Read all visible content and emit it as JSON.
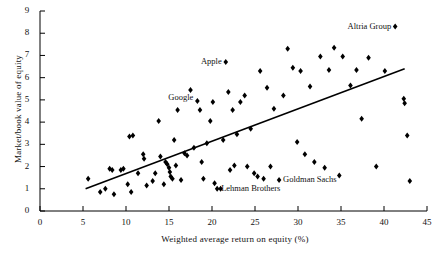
{
  "chart_data": {
    "type": "scatter",
    "title": "",
    "xlabel": "Weighted average return on equity (%)",
    "ylabel": "Market/book value of equity",
    "xlim": [
      0,
      45
    ],
    "ylim": [
      0,
      9
    ],
    "xticks": [
      0,
      5,
      10,
      15,
      20,
      25,
      30,
      35,
      40,
      45
    ],
    "yticks": [
      0,
      1,
      2,
      3,
      4,
      5,
      6,
      7,
      8,
      9
    ],
    "grid": false,
    "legend": "none",
    "trendline": {
      "x0": 5.3,
      "y0": 1.0,
      "x1": 42.4,
      "y1": 6.4
    },
    "annotations": [
      {
        "label": "Altria Group",
        "x": 41.3,
        "y": 8.3,
        "anchor": "right"
      },
      {
        "label": "Apple",
        "x": 21.6,
        "y": 6.7,
        "anchor": "right"
      },
      {
        "label": "Google",
        "x": 18.3,
        "y": 5.1,
        "anchor": "right"
      },
      {
        "label": "Halliburton",
        "x": 47.0,
        "y": 4.9,
        "anchor": "left"
      },
      {
        "label": "Goldman Sachs",
        "x": 27.8,
        "y": 1.4,
        "anchor": "left"
      },
      {
        "label": "Lehman Brothers",
        "x": 20.6,
        "y": 1.0,
        "anchor": "left"
      }
    ],
    "points": [
      {
        "x": 5.6,
        "y": 1.45
      },
      {
        "x": 7.0,
        "y": 0.85
      },
      {
        "x": 7.6,
        "y": 1.0
      },
      {
        "x": 8.1,
        "y": 1.9
      },
      {
        "x": 8.4,
        "y": 1.85
      },
      {
        "x": 8.6,
        "y": 0.75
      },
      {
        "x": 9.4,
        "y": 1.85
      },
      {
        "x": 9.7,
        "y": 1.9
      },
      {
        "x": 10.2,
        "y": 1.2
      },
      {
        "x": 10.4,
        "y": 3.35
      },
      {
        "x": 10.8,
        "y": 3.4
      },
      {
        "x": 10.6,
        "y": 0.85
      },
      {
        "x": 11.4,
        "y": 1.7
      },
      {
        "x": 12.0,
        "y": 2.55
      },
      {
        "x": 12.1,
        "y": 2.35
      },
      {
        "x": 12.4,
        "y": 1.15
      },
      {
        "x": 13.1,
        "y": 1.35
      },
      {
        "x": 13.4,
        "y": 1.7
      },
      {
        "x": 13.8,
        "y": 4.05
      },
      {
        "x": 14.0,
        "y": 2.45
      },
      {
        "x": 14.4,
        "y": 1.2
      },
      {
        "x": 14.6,
        "y": 2.2
      },
      {
        "x": 14.8,
        "y": 2.1
      },
      {
        "x": 15.0,
        "y": 1.95
      },
      {
        "x": 15.1,
        "y": 1.75
      },
      {
        "x": 15.2,
        "y": 1.55
      },
      {
        "x": 15.4,
        "y": 1.45
      },
      {
        "x": 15.6,
        "y": 3.2
      },
      {
        "x": 15.8,
        "y": 2.05
      },
      {
        "x": 16.0,
        "y": 4.55
      },
      {
        "x": 16.4,
        "y": 1.4
      },
      {
        "x": 16.8,
        "y": 2.6
      },
      {
        "x": 17.1,
        "y": 2.5
      },
      {
        "x": 17.5,
        "y": 5.45
      },
      {
        "x": 17.9,
        "y": 2.85
      },
      {
        "x": 18.3,
        "y": 4.95
      },
      {
        "x": 18.6,
        "y": 4.55
      },
      {
        "x": 18.8,
        "y": 2.2
      },
      {
        "x": 19.0,
        "y": 1.45
      },
      {
        "x": 19.4,
        "y": 3.05
      },
      {
        "x": 19.8,
        "y": 4.05
      },
      {
        "x": 20.1,
        "y": 4.9
      },
      {
        "x": 20.3,
        "y": 1.25
      },
      {
        "x": 20.6,
        "y": 1.0
      },
      {
        "x": 21.0,
        "y": 1.0
      },
      {
        "x": 21.3,
        "y": 3.2
      },
      {
        "x": 21.6,
        "y": 6.7
      },
      {
        "x": 21.9,
        "y": 5.35
      },
      {
        "x": 22.1,
        "y": 1.85
      },
      {
        "x": 22.4,
        "y": 4.55
      },
      {
        "x": 22.6,
        "y": 2.05
      },
      {
        "x": 22.9,
        "y": 3.45
      },
      {
        "x": 23.3,
        "y": 4.9
      },
      {
        "x": 23.8,
        "y": 5.2
      },
      {
        "x": 24.1,
        "y": 2.0
      },
      {
        "x": 24.5,
        "y": 3.7
      },
      {
        "x": 24.9,
        "y": 1.7
      },
      {
        "x": 25.3,
        "y": 1.55
      },
      {
        "x": 25.6,
        "y": 6.3
      },
      {
        "x": 26.0,
        "y": 1.45
      },
      {
        "x": 26.4,
        "y": 5.55
      },
      {
        "x": 26.8,
        "y": 2.0
      },
      {
        "x": 27.2,
        "y": 4.6
      },
      {
        "x": 27.8,
        "y": 1.4
      },
      {
        "x": 28.3,
        "y": 5.2
      },
      {
        "x": 28.8,
        "y": 7.3
      },
      {
        "x": 29.4,
        "y": 6.45
      },
      {
        "x": 29.9,
        "y": 3.1
      },
      {
        "x": 30.3,
        "y": 6.3
      },
      {
        "x": 30.8,
        "y": 2.55
      },
      {
        "x": 31.4,
        "y": 5.6
      },
      {
        "x": 31.9,
        "y": 2.2
      },
      {
        "x": 32.6,
        "y": 6.95
      },
      {
        "x": 33.1,
        "y": 1.95
      },
      {
        "x": 33.6,
        "y": 6.35
      },
      {
        "x": 34.2,
        "y": 7.35
      },
      {
        "x": 34.8,
        "y": 1.6
      },
      {
        "x": 35.2,
        "y": 6.95
      },
      {
        "x": 36.1,
        "y": 5.65
      },
      {
        "x": 36.8,
        "y": 6.35
      },
      {
        "x": 37.4,
        "y": 4.15
      },
      {
        "x": 38.2,
        "y": 6.9
      },
      {
        "x": 39.1,
        "y": 2.0
      },
      {
        "x": 40.1,
        "y": 6.3
      },
      {
        "x": 41.3,
        "y": 8.3
      },
      {
        "x": 42.3,
        "y": 5.05
      },
      {
        "x": 42.4,
        "y": 4.85
      },
      {
        "x": 42.7,
        "y": 3.4
      },
      {
        "x": 43.0,
        "y": 1.35
      }
    ]
  }
}
